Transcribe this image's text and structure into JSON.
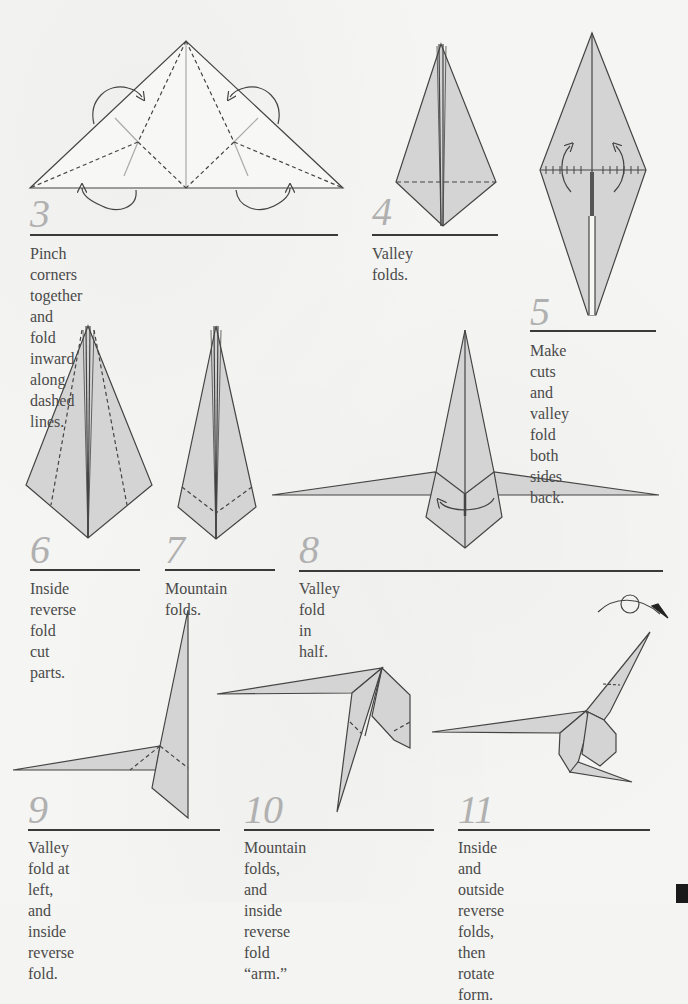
{
  "colors": {
    "paper_fill": "#d4d4d4",
    "line": "#444444",
    "step_number": "#b0b0b0",
    "rule": "#3a3a3a",
    "caption": "#4a4a4a",
    "crease": "#a8a8a8"
  },
  "steps": [
    {
      "number": "3",
      "caption_lines": [
        "Pinch corners together and fold inward",
        "along dashed lines."
      ]
    },
    {
      "number": "4",
      "caption_lines": [
        "Valley folds."
      ]
    },
    {
      "number": "5",
      "caption_lines": [
        "Make cuts and",
        "valley fold both",
        "sides back."
      ]
    },
    {
      "number": "6",
      "caption_lines": [
        "Inside reverse",
        "fold cut parts."
      ]
    },
    {
      "number": "7",
      "caption_lines": [
        "Mountain folds."
      ]
    },
    {
      "number": "8",
      "caption_lines": [
        "Valley fold in half."
      ]
    },
    {
      "number": "9",
      "caption_lines": [
        "Valley fold at left, and",
        "inside reverse fold."
      ]
    },
    {
      "number": "10",
      "caption_lines": [
        "Mountain folds, and inside",
        "reverse fold “arm.”"
      ]
    },
    {
      "number": "11",
      "caption_lines": [
        "Inside and outside reverse",
        "folds, then rotate form."
      ]
    }
  ]
}
